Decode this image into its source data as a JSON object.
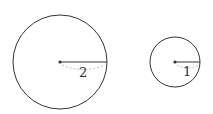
{
  "diagram": {
    "type": "geometry",
    "circles": [
      {
        "name": "large-circle",
        "cx": 60,
        "cy": 62,
        "r": 47,
        "radius_label": "2"
      },
      {
        "name": "small-circle",
        "cx": 175,
        "cy": 62,
        "r": 25,
        "radius_label": "1"
      }
    ],
    "colors": {
      "stroke": "#333333",
      "dashed": "#bbbbbb"
    }
  }
}
